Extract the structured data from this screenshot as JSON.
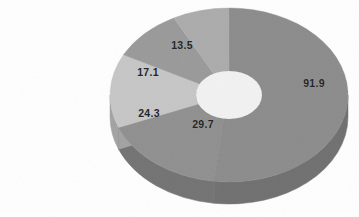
{
  "chart_data": {
    "type": "pie",
    "variant": "doughnut-3d",
    "title": "",
    "subtitle": "",
    "xlabel": "",
    "ylabel": "",
    "legend": [],
    "legend_position": "none",
    "grid": false,
    "total": 176.5,
    "labels": [
      "91.9",
      "29.7",
      "24.3",
      "17.1",
      "13.5"
    ],
    "values": [
      91.9,
      29.7,
      24.3,
      17.1,
      13.5
    ],
    "categories": [
      "91.9",
      "29.7",
      "24.3",
      "17.1",
      "13.5"
    ],
    "slices": [
      {
        "label": "91.9",
        "value": 91.9,
        "percent": 52.1,
        "start_angle": 0,
        "end_angle": 187.4,
        "color": "#8b8b8b",
        "side_color": "#6f6f6f",
        "label_x": 314,
        "label_y": 83
      },
      {
        "label": "29.7",
        "value": 29.7,
        "percent": 16.8,
        "start_angle": 187.4,
        "end_angle": 248.0,
        "color": "#8f8f8f",
        "side_color": "#727272",
        "label_x": 203,
        "label_y": 124
      },
      {
        "label": "24.3",
        "value": 24.3,
        "percent": 13.8,
        "start_angle": 248.0,
        "end_angle": 297.5,
        "color": "#c6c6c6",
        "side_color": "#a2a2a2",
        "label_x": 149,
        "label_y": 113
      },
      {
        "label": "17.1",
        "value": 17.1,
        "percent": 9.7,
        "start_angle": 297.5,
        "end_angle": 332.4,
        "color": "#999999",
        "side_color": "#7c7c7c",
        "label_x": 148,
        "label_y": 72
      },
      {
        "label": "13.5",
        "value": 13.5,
        "percent": 7.6,
        "start_angle": 332.4,
        "end_angle": 360,
        "color": "#ababab",
        "side_color": "#8c8c8c",
        "label_x": 182,
        "label_y": 45
      }
    ],
    "geometry": {
      "center_x": 229,
      "center_y": 95,
      "radius_x": 119,
      "radius_y": 87,
      "hole_radius_x": 33,
      "hole_radius_y": 24,
      "depth": 22
    },
    "colors": {
      "background": "#ffffff",
      "label_text": "#252525",
      "hole_top": "#f2f2f2",
      "hole_wall": "#6b6b6b"
    }
  }
}
